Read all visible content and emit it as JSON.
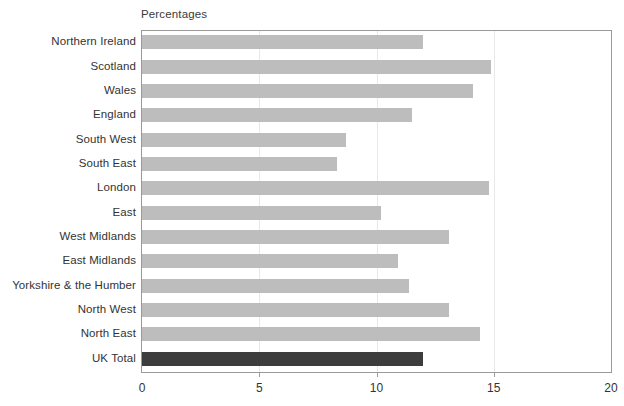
{
  "chart_data": {
    "type": "bar",
    "orientation": "horizontal",
    "title": "Percentages",
    "xlabel": "",
    "ylabel": "",
    "xlim": [
      0,
      20
    ],
    "xticks": [
      0,
      5,
      10,
      15,
      20
    ],
    "xtick_labels": [
      "0",
      "5",
      "10",
      "15",
      "20"
    ],
    "grid": true,
    "grid_axis": "x",
    "legend": "none",
    "bar_color": "#bdbdbd",
    "highlight_color": "#3d3d3d",
    "categories": [
      "Northern Ireland",
      "Scotland",
      "Wales",
      "England",
      "South West",
      "South East",
      "London",
      "East",
      "West Midlands",
      "East Midlands",
      "Yorkshire & the Humber",
      "North West",
      "North East",
      "UK Total"
    ],
    "values": [
      12.0,
      14.9,
      14.1,
      11.5,
      8.7,
      8.3,
      14.8,
      10.2,
      13.1,
      10.9,
      11.4,
      13.1,
      14.4,
      12.0
    ],
    "highlight_category": "UK Total",
    "series": [
      {
        "name": "Percentages",
        "values": [
          12.0,
          14.9,
          14.1,
          11.5,
          8.7,
          8.3,
          14.8,
          10.2,
          13.1,
          10.9,
          11.4,
          13.1,
          14.4,
          12.0
        ]
      }
    ]
  }
}
